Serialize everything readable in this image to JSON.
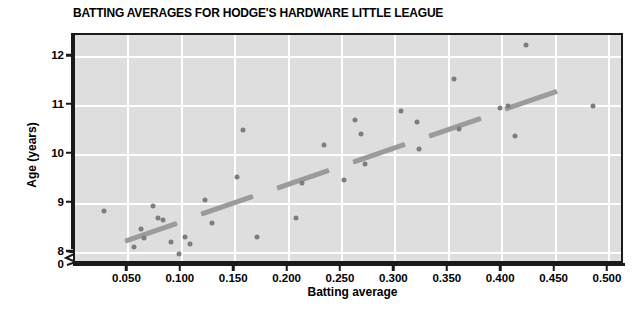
{
  "chart_data": {
    "type": "scatter",
    "title": "BATTING AVERAGES FOR HODGE'S HARDWARE LITTLE LEAGUE",
    "xlabel": "Batting average",
    "ylabel": "Age (years)",
    "xlim": [
      0.0,
      0.515
    ],
    "ylim": [
      7.75,
      12.45
    ],
    "y_axis_broken": true,
    "y_break_label": "0",
    "grid": true,
    "legend": "none",
    "xticks": [
      0.05,
      0.1,
      0.15,
      0.2,
      0.25,
      0.3,
      0.35,
      0.4,
      0.45,
      0.5
    ],
    "xtick_labels": [
      "0.050",
      "0.100",
      "0.150",
      "0.200",
      "0.250",
      "0.300",
      "0.350",
      "0.400",
      "0.450",
      "0.500"
    ],
    "yticks": [
      8,
      9,
      10,
      11,
      12
    ],
    "ytick_labels": [
      "8",
      "9",
      "10",
      "11",
      "12"
    ],
    "points": [
      {
        "x": 0.027,
        "y": 8.85
      },
      {
        "x": 0.055,
        "y": 8.12
      },
      {
        "x": 0.062,
        "y": 8.48
      },
      {
        "x": 0.065,
        "y": 8.3
      },
      {
        "x": 0.073,
        "y": 8.95
      },
      {
        "x": 0.078,
        "y": 8.72
      },
      {
        "x": 0.082,
        "y": 8.67
      },
      {
        "x": 0.09,
        "y": 8.22
      },
      {
        "x": 0.097,
        "y": 7.97
      },
      {
        "x": 0.103,
        "y": 8.33
      },
      {
        "x": 0.108,
        "y": 8.18
      },
      {
        "x": 0.122,
        "y": 9.07
      },
      {
        "x": 0.128,
        "y": 8.6
      },
      {
        "x": 0.152,
        "y": 9.55
      },
      {
        "x": 0.157,
        "y": 10.5
      },
      {
        "x": 0.17,
        "y": 8.32
      },
      {
        "x": 0.207,
        "y": 8.72
      },
      {
        "x": 0.213,
        "y": 9.42
      },
      {
        "x": 0.233,
        "y": 10.2
      },
      {
        "x": 0.252,
        "y": 9.48
      },
      {
        "x": 0.262,
        "y": 10.72
      },
      {
        "x": 0.268,
        "y": 10.42
      },
      {
        "x": 0.272,
        "y": 9.82
      },
      {
        "x": 0.305,
        "y": 10.9
      },
      {
        "x": 0.32,
        "y": 10.68
      },
      {
        "x": 0.322,
        "y": 10.12
      },
      {
        "x": 0.355,
        "y": 11.55
      },
      {
        "x": 0.36,
        "y": 10.52
      },
      {
        "x": 0.398,
        "y": 10.95
      },
      {
        "x": 0.405,
        "y": 11.0
      },
      {
        "x": 0.412,
        "y": 10.38
      },
      {
        "x": 0.422,
        "y": 12.25
      },
      {
        "x": 0.485,
        "y": 11.0
      }
    ],
    "trend_line": {
      "style": "dashed",
      "color": "#9b9b9b",
      "x_start": 0.047,
      "y_start": 8.25,
      "x_end": 0.452,
      "y_end": 11.3
    },
    "colors": {
      "plot_background": "#dedede",
      "gridline": "#ffffff",
      "point": "#7d7d7d",
      "axis": "#1a1a1a",
      "title": "#000000"
    }
  }
}
